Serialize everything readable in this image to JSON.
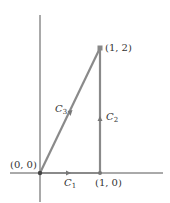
{
  "figure": {
    "type": "line-integral-path-diagram",
    "points": [
      {
        "id": "origin",
        "label": "(0, 0)",
        "x": 0,
        "y": 0
      },
      {
        "id": "p10",
        "label": "(1, 0)",
        "x": 1,
        "y": 0
      },
      {
        "id": "p12",
        "label": "(1, 2)",
        "x": 1,
        "y": 2
      }
    ],
    "curves": [
      {
        "id": "C1",
        "name": "C",
        "sub": "1",
        "from": "(0, 0)",
        "to": "(1, 0)",
        "direction": "right"
      },
      {
        "id": "C2",
        "name": "C",
        "sub": "2",
        "from": "(1, 0)",
        "to": "(1, 2)",
        "direction": "up"
      },
      {
        "id": "C3",
        "name": "C",
        "sub": "3",
        "from": "(1, 2)",
        "to": "(0, 0)",
        "direction": "down-left"
      }
    ],
    "colors": {
      "path": "#8a8a8a",
      "axis": "#555555",
      "point": "#555555",
      "text": "#333333"
    }
  }
}
